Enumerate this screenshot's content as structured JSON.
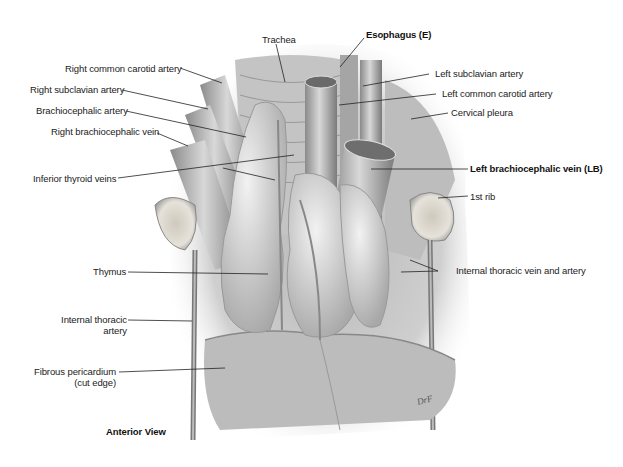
{
  "figure": {
    "view_caption": "Anterior View",
    "labels": {
      "trachea": "Trachea",
      "esophagus": "Esophagus (E)",
      "right_common_carotid": "Right common carotid artery",
      "right_subclavian": "Right subclavian artery",
      "brachiocephalic_artery": "Brachiocephalic artery",
      "right_brachiocephalic_vein": "Right brachiocephalic vein",
      "inferior_thyroid_veins": "Inferior thyroid veins",
      "left_subclavian": "Left subclavian artery",
      "left_common_carotid": "Left common carotid artery",
      "cervical_pleura": "Cervical pleura",
      "left_brachiocephalic_vein": "Left brachiocephalic vein (LB)",
      "first_rib": "1st rib",
      "thymus": "Thymus",
      "internal_thoracic_vein_artery": "Internal thoracic vein and artery",
      "internal_thoracic_artery_line1": "Internal thoracic",
      "internal_thoracic_artery_line2": "artery",
      "fibrous_pericardium_line1": "Fibrous pericardium",
      "fibrous_pericardium_line2": "(cut edge)"
    },
    "colors": {
      "background": "#ffffff",
      "label_text": "#222222",
      "leader_line": "#222222"
    }
  }
}
